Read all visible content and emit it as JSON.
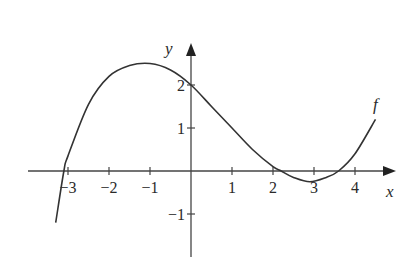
{
  "chart_data": {
    "type": "line",
    "title": "",
    "xlabel": "x",
    "ylabel": "y",
    "xlim": [
      -3.4,
      4.8
    ],
    "ylim": [
      -1.9,
      3.0
    ],
    "grid": false,
    "x_ticks": [
      -3,
      -2,
      -1,
      1,
      2,
      3,
      4
    ],
    "x_tick_labels": [
      "−3",
      "−2",
      "−1",
      "1",
      "2",
      "3",
      "4"
    ],
    "y_ticks": [
      2,
      1,
      -1
    ],
    "y_tick_labels": [
      "2",
      "1",
      "−1"
    ],
    "series": [
      {
        "name": "f",
        "label": "f",
        "x": [
          -3.3,
          -3.1,
          -3.0,
          -2.5,
          -2.0,
          -1.5,
          -1.0,
          -0.5,
          0.0,
          0.5,
          1.0,
          1.5,
          2.0,
          2.2,
          2.5,
          2.9,
          3.3,
          3.6,
          4.0,
          4.5
        ],
        "y": [
          -1.2,
          0.0,
          0.35,
          1.55,
          2.2,
          2.45,
          2.5,
          2.35,
          2.0,
          1.5,
          1.0,
          0.5,
          0.1,
          0.0,
          -0.15,
          -0.25,
          -0.15,
          0.0,
          0.4,
          1.2
        ]
      }
    ]
  },
  "labels": {
    "x_axis": "x",
    "y_axis": "y",
    "curve": "f",
    "x_ticks": [
      "−3",
      "−2",
      "−1",
      "1",
      "2",
      "3",
      "4"
    ],
    "y_ticks": [
      "2",
      "1",
      "−1"
    ]
  }
}
